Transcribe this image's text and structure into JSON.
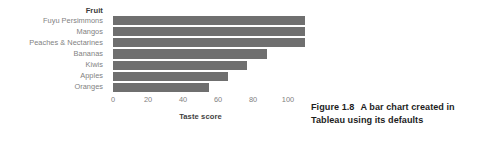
{
  "figure": {
    "caption_number": "Figure 1.8",
    "caption_text": "A bar chart created in Tableau using its defaults"
  },
  "chart_data": {
    "type": "bar",
    "orientation": "horizontal",
    "title": "",
    "category_axis_title": "Fruit",
    "xlabel": "Taste score",
    "ylabel": "Fruit",
    "categories": [
      "Fuyu Persimmons",
      "Mangos",
      "Peaches & Nectarines",
      "Bananas",
      "Kiwis",
      "Apples",
      "Oranges"
    ],
    "values": [
      100,
      100,
      100,
      80,
      70,
      60,
      50
    ],
    "xticks": [
      0,
      20,
      40,
      60,
      80,
      100
    ],
    "xtick_labels": [
      "0",
      "20",
      "40",
      "60",
      "80",
      "100"
    ],
    "xlim": [
      0,
      100
    ],
    "grid": false,
    "legend": false,
    "bar_color": "#6f6f6f",
    "label_color": "#818181"
  }
}
